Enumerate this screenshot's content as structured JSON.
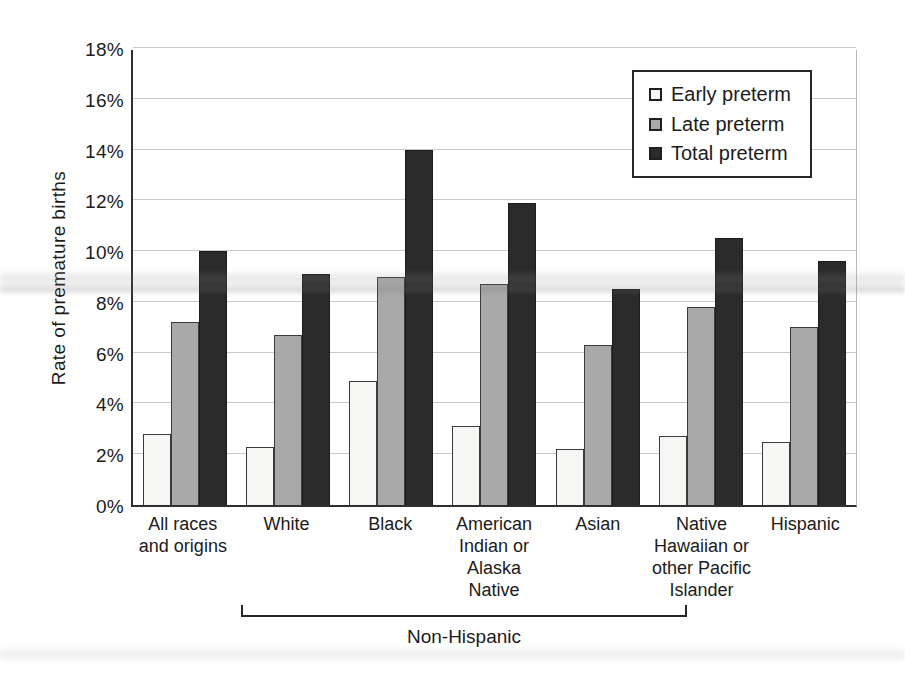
{
  "chart_data": {
    "type": "bar",
    "title": "",
    "xlabel": "",
    "ylabel": "Rate of premature births",
    "ylim": [
      0,
      18
    ],
    "ytick_step": 2,
    "ytick_suffix": "%",
    "grid": true,
    "legend_position": "top-right",
    "categories": [
      "All races\nand origins",
      "White",
      "Black",
      "American\nIndian or\nAlaska\nNative",
      "Asian",
      "Native\nHawaiian or\nother Pacific\nIslander",
      "Hispanic"
    ],
    "series": [
      {
        "name": "Early preterm",
        "color": "#f6f6f4",
        "border": "#3b3b3b",
        "values": [
          2.8,
          2.3,
          4.9,
          3.1,
          2.2,
          2.7,
          2.5
        ]
      },
      {
        "name": "Late preterm",
        "color": "#a9a9a9",
        "border": "#3b3b3b",
        "values": [
          7.2,
          6.7,
          9.0,
          8.7,
          6.3,
          7.8,
          7.0
        ]
      },
      {
        "name": "Total preterm",
        "color": "#2b2b2b",
        "border": "#1c1c1c",
        "values": [
          10.0,
          9.1,
          14.0,
          11.9,
          8.5,
          10.5,
          9.6
        ]
      }
    ],
    "group_annotation": {
      "label": "Non-Hispanic",
      "from_category": "White",
      "to_category": "Native\nHawaiian or\nother Pacific\nIslander"
    }
  }
}
